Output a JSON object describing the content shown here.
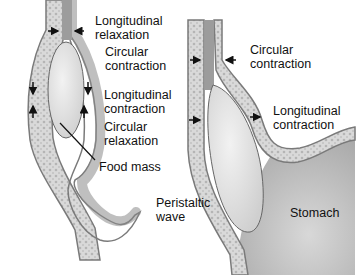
{
  "diagram": {
    "left_panel": {
      "labels": {
        "longitudinal_relaxation": [
          "Longitudinal",
          "relaxation"
        ],
        "circular_contraction": [
          "Circular",
          "contraction"
        ],
        "longitudinal_contraction": [
          "Longitudinal",
          "contraction"
        ],
        "circular_relaxation": [
          "Circular",
          "relaxation"
        ],
        "food_mass": "Food mass"
      }
    },
    "right_panel": {
      "labels": {
        "circular_contraction": [
          "Circular",
          "contraction"
        ],
        "longitudinal_contraction": [
          "Longitudinal",
          "contraction"
        ],
        "peristaltic_wave": [
          "Peristaltic",
          "wave"
        ],
        "stomach": "Stomach"
      }
    },
    "colors": {
      "background": "#ffffff",
      "wall_outer": "#8a8a8a",
      "wall_fill": "#d6d6d6",
      "lumen": "#b8b8b8",
      "food_mass": "#e6e6e6",
      "stomach": "#cfcfcf",
      "text": "#111111"
    }
  }
}
